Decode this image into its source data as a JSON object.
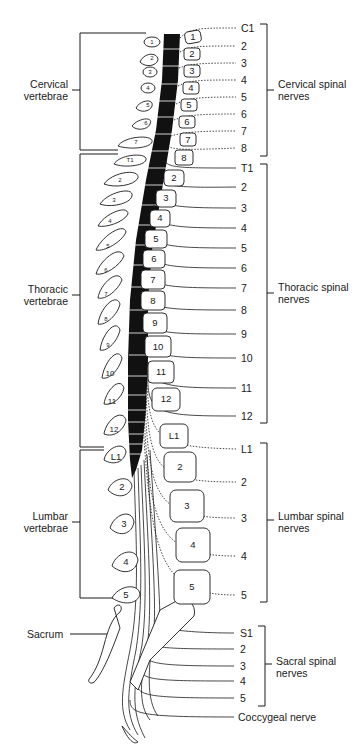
{
  "figure": {
    "type": "anatomical diagram"
  },
  "left_groups": [
    {
      "label_line1": "Cervical",
      "label_line2": "vertebrae",
      "top": 35,
      "bottom": 150,
      "label_y": 78
    },
    {
      "label_line1": "Thoracic",
      "label_line2": "vertebrae",
      "top": 153,
      "bottom": 447,
      "label_y": 293
    },
    {
      "label_line1": "Lumbar",
      "label_line2": "vertebrae",
      "top": 451,
      "bottom": 598,
      "label_y": 515
    }
  ],
  "sacrum_label": "Sacrum",
  "right_groups": [
    {
      "label_line1": "Cervical spinal",
      "label_line2": "nerves",
      "top": 24,
      "bottom": 156,
      "label_y": 83
    },
    {
      "label_line1": "Thoracic spinal",
      "label_line2": "nerves",
      "top": 164,
      "bottom": 423,
      "label_y": 291
    },
    {
      "label_line1": "Lumbar spinal",
      "label_line2": "nerves",
      "top": 443,
      "bottom": 602,
      "label_y": 515
    },
    {
      "label_line1": "Sacral spinal",
      "label_line2": "nerves",
      "top": 626,
      "bottom": 706,
      "label_y": 658
    }
  ],
  "nerve_labels": {
    "cervical": [
      "C1",
      "2",
      "3",
      "4",
      "5",
      "6",
      "7",
      "8"
    ],
    "thoracic": [
      "T1",
      "2",
      "3",
      "4",
      "5",
      "6",
      "7",
      "8",
      "9",
      "10",
      "11",
      "12"
    ],
    "lumbar": [
      "L1",
      "2",
      "3",
      "4",
      "5"
    ],
    "sacral": [
      "S1",
      "2",
      "3",
      "4",
      "5"
    ],
    "coccygeal": "Coccygeal nerve"
  },
  "vertebra_body_labels": {
    "cervical": [
      "1",
      "2",
      "3",
      "4",
      "5",
      "6",
      "7",
      "8"
    ],
    "thoracic": [
      "2",
      "3",
      "4",
      "5",
      "6",
      "7",
      "8",
      "9",
      "10",
      "11",
      "12"
    ],
    "lumbar": [
      "L1",
      "2",
      "3",
      "4",
      "5"
    ]
  },
  "spinous_process_labels": {
    "cervical": [
      "1",
      "2",
      "3",
      "4",
      "5",
      "6",
      "7"
    ],
    "thoracic": [
      "T1",
      "2",
      "3",
      "4",
      "5",
      "6",
      "7",
      "8",
      "9",
      "10",
      "11",
      "12"
    ],
    "lumbar": [
      "L1",
      "2",
      "3",
      "4",
      "5"
    ]
  }
}
